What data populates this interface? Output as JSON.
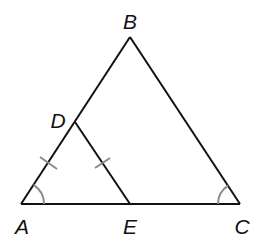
{
  "diagram": {
    "type": "geometry",
    "colors": {
      "line": "#111111",
      "marks": "#8a8a8a",
      "background": "#ffffff"
    },
    "points": {
      "A": {
        "label": "A",
        "x": 21,
        "y": 204
      },
      "B": {
        "label": "B",
        "x": 130,
        "y": 37
      },
      "C": {
        "label": "C",
        "x": 240,
        "y": 204
      },
      "D": {
        "label": "D",
        "x": 75,
        "y": 122
      },
      "E": {
        "label": "E",
        "x": 130,
        "y": 204
      }
    },
    "labels": {
      "A": "A",
      "B": "B",
      "C": "C",
      "D": "D",
      "E": "E"
    },
    "segments": [
      "AB",
      "BC",
      "CA",
      "DE"
    ],
    "congruent_segments": [
      "AD",
      "DE"
    ],
    "congruent_angles": [
      "A",
      "C"
    ]
  }
}
